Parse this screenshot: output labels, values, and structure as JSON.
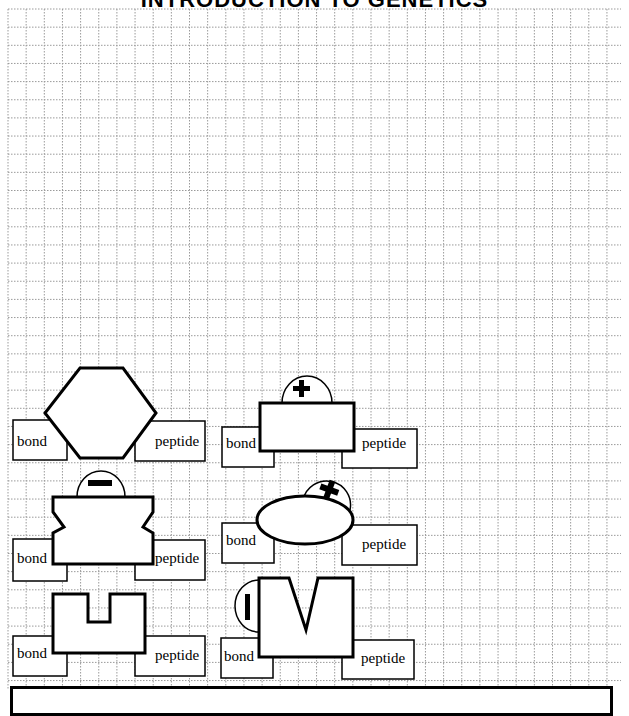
{
  "page": {
    "title": "INTRODUCTION TO GENETICS"
  },
  "grid": {
    "left": 8,
    "top": 9,
    "right": 621,
    "bottom": 690,
    "cell": 18.15,
    "line_color": "#9a9a9a"
  },
  "pieces": [
    {
      "id": 1,
      "shape": "hexagon",
      "charge": null,
      "left_label": "bond",
      "right_label": "peptide"
    },
    {
      "id": 2,
      "shape": "rectangle",
      "charge": "+",
      "left_label": "bond",
      "right_label": "peptide"
    },
    {
      "id": 3,
      "shape": "notched-block",
      "charge": "−",
      "left_label": "bond",
      "right_label": "peptide"
    },
    {
      "id": 4,
      "shape": "ellipse",
      "charge": "+",
      "left_label": "bond",
      "right_label": "peptide"
    },
    {
      "id": 5,
      "shape": "u-block",
      "charge": null,
      "left_label": "bond",
      "right_label": "peptide"
    },
    {
      "id": 6,
      "shape": "v-block",
      "charge": "−",
      "left_label": "bond",
      "right_label": "peptide"
    }
  ],
  "answer_box": {
    "text": ""
  }
}
